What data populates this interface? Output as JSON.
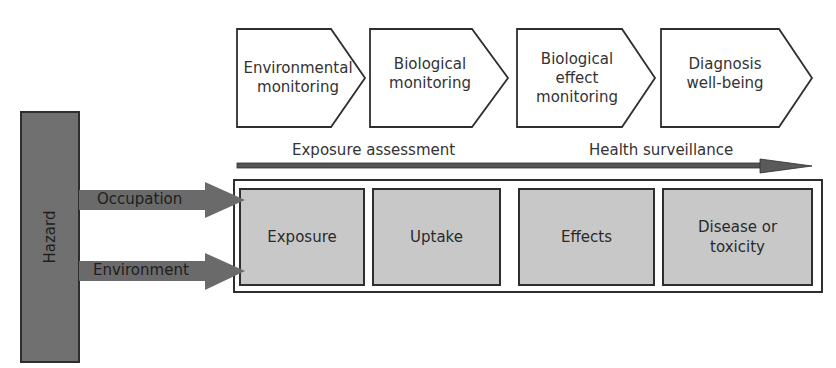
{
  "diagram": {
    "hazard": {
      "label": "Hazard"
    },
    "routes": [
      {
        "label": "Occupation"
      },
      {
        "label": "Environment"
      }
    ],
    "monitoring_stages": [
      {
        "line1": "Environmental",
        "line2": "monitoring",
        "line3": ""
      },
      {
        "line1": "Biological",
        "line2": "monitoring",
        "line3": ""
      },
      {
        "line1": "Biological",
        "line2": "effect",
        "line3": "monitoring"
      },
      {
        "line1": "Diagnosis",
        "line2": "well-being",
        "line3": ""
      }
    ],
    "timeline": {
      "left_label": "Exposure assessment",
      "right_label": "Health surveillance"
    },
    "process_boxes": [
      {
        "line1": "Exposure",
        "line2": ""
      },
      {
        "line1": "Uptake",
        "line2": ""
      },
      {
        "line1": "Effects",
        "line2": ""
      },
      {
        "line1": "Disease or",
        "line2": "toxicity"
      }
    ],
    "colors": {
      "hazard_fill": "#707070",
      "arrow_fill": "#6a6a6a",
      "box_fill": "#c8c8c8",
      "stroke": "#2e2e2e"
    }
  }
}
